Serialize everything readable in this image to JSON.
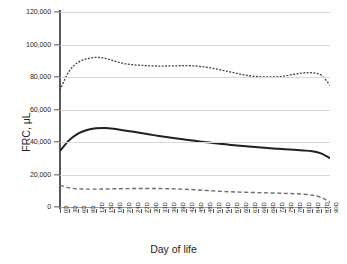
{
  "figure": {
    "background": "#ffffff",
    "axis_color": "#58595b",
    "grid_color": "#d9d9d9"
  },
  "chart_data": {
    "type": "line",
    "title": "",
    "xlabel": "Day of life",
    "ylabel": "FRC, μL",
    "xlim": [
      0,
      90
    ],
    "ylim": [
      0,
      120000
    ],
    "grid": true,
    "legend": "none",
    "yticks": [
      0,
      20000,
      40000,
      60000,
      80000,
      100000,
      120000
    ],
    "ytick_labels": [
      "0",
      "20,000",
      "40,000",
      "60,000",
      "80,000",
      "100,000",
      "120,000"
    ],
    "xticks": [
      0,
      3,
      6,
      9,
      12,
      15,
      18,
      21,
      24,
      27,
      30,
      33,
      36,
      39,
      42,
      45,
      48,
      51,
      54,
      57,
      60,
      63,
      66,
      69,
      72,
      75,
      78,
      81,
      84,
      87,
      90
    ],
    "xtick_labels": [
      "0D",
      "3D",
      "6D",
      "9D",
      "12D",
      "15D",
      "18D",
      "21D",
      "24D",
      "27D",
      "30D",
      "33D",
      "36D",
      "39D",
      "42D",
      "45D",
      "48D",
      "51D",
      "54D",
      "57D",
      "60D",
      "63D",
      "66D",
      "69D",
      "72D",
      "75D",
      "78D",
      "81D",
      "84D",
      "87D",
      "90D"
    ],
    "x": [
      0,
      3,
      6,
      9,
      12,
      15,
      18,
      21,
      24,
      27,
      30,
      33,
      36,
      39,
      42,
      45,
      48,
      51,
      54,
      57,
      60,
      63,
      66,
      69,
      72,
      75,
      78,
      81,
      84,
      87,
      90
    ],
    "series": [
      {
        "name": "upper-dotted-curve",
        "style": "dotted",
        "color": "#3f3f3f",
        "width": 1.3,
        "values": [
          72000,
          83500,
          89000,
          91200,
          92100,
          91500,
          89800,
          88400,
          87600,
          87200,
          86900,
          86700,
          86800,
          86900,
          87000,
          86800,
          86200,
          85300,
          84200,
          83000,
          81800,
          80800,
          80200,
          80000,
          80100,
          80700,
          81700,
          82500,
          82600,
          81200,
          75000
        ]
      },
      {
        "name": "middle-solid-curve",
        "style": "solid",
        "color": "#231f20",
        "width": 2.0,
        "values": [
          34500,
          41000,
          45200,
          47400,
          48400,
          48600,
          48100,
          47300,
          46400,
          45500,
          44600,
          43700,
          42900,
          42100,
          41400,
          40700,
          40000,
          39400,
          38800,
          38200,
          37700,
          37200,
          36700,
          36300,
          35900,
          35500,
          35200,
          34800,
          34300,
          33000,
          30000
        ]
      },
      {
        "name": "lower-dashed-curve",
        "style": "dashed",
        "color": "#6e6e6e",
        "width": 1.4,
        "values": [
          13500,
          11800,
          11200,
          11000,
          11000,
          11100,
          11200,
          11300,
          11350,
          11400,
          11400,
          11350,
          11250,
          11100,
          10900,
          10600,
          10250,
          9900,
          9600,
          9350,
          9150,
          9000,
          8850,
          8700,
          8550,
          8400,
          8200,
          7900,
          7300,
          6000,
          3000
        ]
      }
    ]
  },
  "caption": {
    "text": ""
  }
}
